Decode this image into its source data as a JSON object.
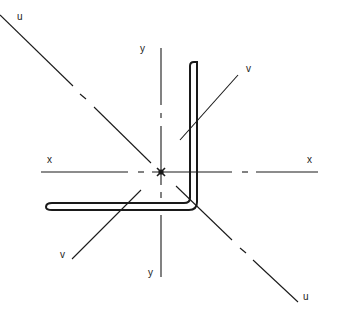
{
  "diagram": {
    "type": "angle-section-principal-axes",
    "colors": {
      "line": "#1a1a1a",
      "background": "#ffffff"
    },
    "centroid": {
      "x": 161,
      "y": 172
    },
    "axes": {
      "x": {
        "label_left": "x",
        "label_right": "x"
      },
      "y": {
        "label_top": "y",
        "label_bottom": "y"
      },
      "u": {
        "label_top": "u",
        "label_bottom": "u"
      },
      "v": {
        "label_top": "v",
        "label_bottom": "v"
      }
    },
    "section": {
      "shape": "equal-leg angle (L-section)"
    }
  }
}
